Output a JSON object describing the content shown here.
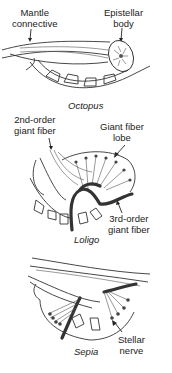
{
  "panels": [
    {
      "caption": "Octopus",
      "labels": {
        "mantle_connective": [
          "Mantle",
          "connective"
        ],
        "epistellar_body": [
          "Epistellar",
          "body"
        ]
      }
    },
    {
      "caption": "Loligo",
      "labels": {
        "second_order": [
          "2nd-order",
          "giant fiber"
        ],
        "giant_fiber_lobe": [
          "Giant fiber",
          "lobe"
        ],
        "third_order": [
          "3rd-order",
          "giant fiber"
        ]
      }
    },
    {
      "caption": "Sepia",
      "labels": {
        "stellar_nerve": [
          "Stellar",
          "nerve"
        ]
      }
    }
  ],
  "colors": {
    "line": "#333333",
    "background": "#ffffff"
  }
}
